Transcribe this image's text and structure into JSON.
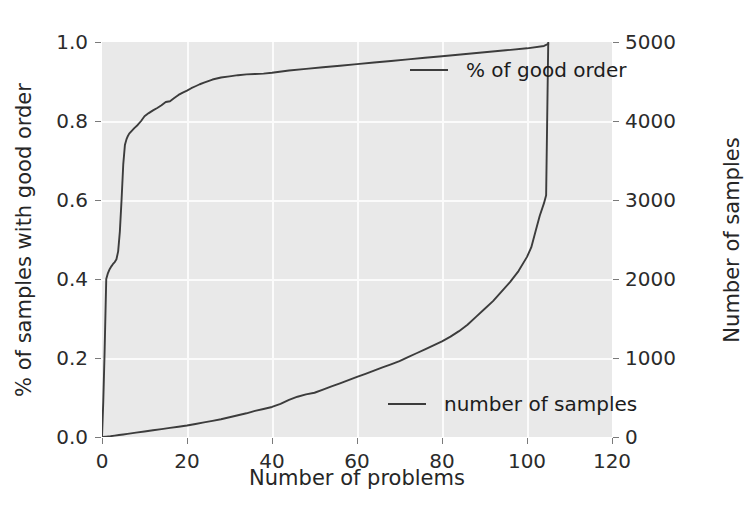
{
  "chart_data": {
    "type": "line",
    "title": "",
    "xlabel": "Number of problems",
    "ylabel_left": "% of samples with good order",
    "ylabel_right": "Number of samples",
    "grid": true,
    "legend_position": "inside-right",
    "xlim": [
      0,
      120
    ],
    "ylim_left": [
      0.0,
      1.0
    ],
    "ylim_right": [
      0,
      5000
    ],
    "xticks": [
      0,
      20,
      40,
      60,
      80,
      100,
      120
    ],
    "xtick_labels": [
      "0",
      "20",
      "40",
      "60",
      "80",
      "100",
      "120"
    ],
    "yticks_left": [
      0.0,
      0.2,
      0.4,
      0.6,
      0.8,
      1.0
    ],
    "ytick_labels_left": [
      "0.0",
      "0.2",
      "0.4",
      "0.6",
      "0.8",
      "1.0"
    ],
    "yticks_right": [
      0,
      1000,
      2000,
      3000,
      4000,
      5000
    ],
    "ytick_labels_right": [
      "0",
      "1000",
      "2000",
      "3000",
      "4000",
      "5000"
    ],
    "series": [
      {
        "name": "% of good order",
        "axis": "left",
        "color": "#3c3c3c",
        "x": [
          0,
          0.3,
          0.6,
          1.0,
          1.4,
          1.8,
          2.2,
          2.6,
          3.0,
          3.4,
          3.8,
          4.2,
          4.6,
          5.0,
          5.4,
          5.8,
          6.0,
          6.4,
          7.0,
          7.6,
          8.4,
          9.2,
          10.0,
          11.0,
          12.0,
          13.0,
          14.0,
          15.0,
          16.0,
          17.0,
          18.0,
          19.0,
          20.0,
          21.0,
          22.0,
          23.0,
          24.0,
          25.0,
          26.0,
          28.0,
          30.0,
          32.0,
          34.0,
          36.0,
          38.0,
          40.0,
          44.0,
          48.0,
          52.0,
          56.0,
          60.0,
          64.0,
          68.0,
          72.0,
          76.0,
          80.0,
          85.0,
          90.0,
          95.0,
          100.0,
          104.0,
          105.0
        ],
        "y": [
          0.0,
          0.09,
          0.21,
          0.4,
          0.415,
          0.425,
          0.432,
          0.438,
          0.443,
          0.45,
          0.47,
          0.52,
          0.6,
          0.69,
          0.74,
          0.755,
          0.76,
          0.768,
          0.775,
          0.782,
          0.79,
          0.8,
          0.812,
          0.82,
          0.827,
          0.833,
          0.84,
          0.848,
          0.85,
          0.858,
          0.866,
          0.872,
          0.877,
          0.883,
          0.888,
          0.893,
          0.897,
          0.901,
          0.905,
          0.91,
          0.913,
          0.916,
          0.918,
          0.919,
          0.92,
          0.922,
          0.928,
          0.932,
          0.936,
          0.94,
          0.944,
          0.948,
          0.952,
          0.956,
          0.96,
          0.964,
          0.969,
          0.974,
          0.979,
          0.984,
          0.99,
          0.995
        ]
      },
      {
        "name": "number of samples",
        "axis": "right",
        "color": "#3c3c3c",
        "x": [
          0,
          1,
          2,
          3,
          4,
          5,
          6,
          8,
          10,
          12,
          14,
          16,
          18,
          20,
          22,
          24,
          26,
          28,
          30,
          32,
          34,
          36,
          38,
          40,
          42,
          44,
          46,
          48,
          50,
          52,
          54,
          56,
          58,
          60,
          62,
          64,
          66,
          68,
          70,
          72,
          74,
          76,
          78,
          80,
          82,
          84,
          86,
          88,
          90,
          92,
          94,
          96,
          98,
          100,
          101,
          102,
          103,
          104,
          104.5,
          105
        ],
        "y": [
          0,
          5,
          10,
          18,
          25,
          32,
          40,
          55,
          70,
          85,
          100,
          115,
          130,
          145,
          165,
          185,
          205,
          225,
          250,
          275,
          300,
          330,
          355,
          380,
          420,
          470,
          510,
          540,
          560,
          600,
          640,
          680,
          720,
          760,
          800,
          840,
          880,
          920,
          960,
          1010,
          1060,
          1110,
          1160,
          1210,
          1270,
          1340,
          1420,
          1520,
          1620,
          1720,
          1840,
          1960,
          2100,
          2280,
          2400,
          2600,
          2800,
          2960,
          3060,
          5000
        ]
      }
    ]
  },
  "legend": {
    "good_order": "% of good order",
    "num_samples": "number of samples"
  },
  "axes": {
    "xlabel": "Number of problems",
    "ylabel_left": "% of samples with good order",
    "ylabel_right": "Number of samples"
  },
  "colors": {
    "line": "#3c3c3c",
    "plot_background": "#e9e9e9",
    "grid": "#fbfbfb",
    "page_background": "#ffffff",
    "text": "#262626"
  }
}
